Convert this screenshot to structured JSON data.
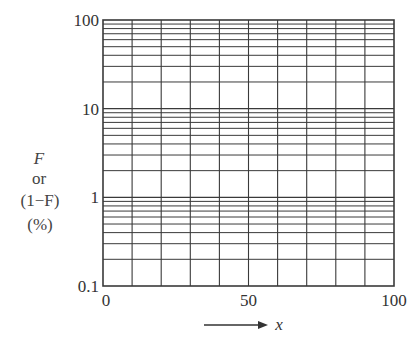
{
  "chart_data": {
    "type": "line",
    "title": "",
    "subtitle": "",
    "series": [],
    "xlabel": "x",
    "xlabel_arrow": true,
    "ylabel_lines": [
      "F",
      "or",
      "(1−F)",
      "(%)"
    ],
    "x_scale": "linear",
    "y_scale": "log",
    "xlim": [
      0,
      100
    ],
    "ylim": [
      0.1,
      100
    ],
    "x_ticks": [
      0,
      50,
      100
    ],
    "x_tick_labels": [
      "0",
      "50",
      "100"
    ],
    "y_ticks": [
      0.1,
      1,
      10,
      100
    ],
    "y_tick_labels": [
      "0.1",
      "1",
      "10",
      "100"
    ],
    "x_grid_step": 10,
    "y_grid_minor_multipliers": [
      1,
      2,
      3,
      4,
      5,
      6,
      7,
      8,
      9
    ],
    "grid": true,
    "legend": "none",
    "colors": {
      "grid": "#3a3a3a",
      "text": "#333333",
      "background": "#ffffff"
    }
  }
}
